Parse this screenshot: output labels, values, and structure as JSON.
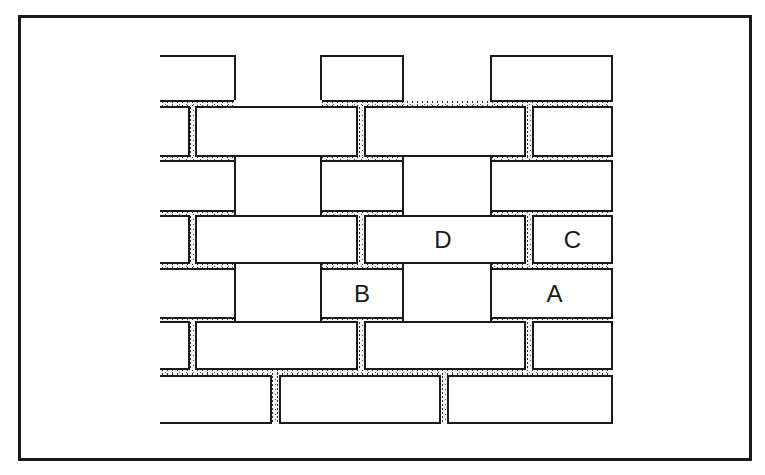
{
  "figure": {
    "type": "brick-wall-diagram",
    "colors": {
      "line": "#1a1a1a",
      "mortar_dots": "#333333",
      "background": "#ffffff"
    }
  },
  "labels": {
    "A": "A",
    "B": "B",
    "C": "C",
    "D": "D"
  },
  "rows": [
    {
      "row": 1,
      "bricks": [
        "",
        "",
        ""
      ]
    },
    {
      "row": 2,
      "bricks": [
        "",
        "",
        "",
        ""
      ]
    },
    {
      "row": 3,
      "bricks": [
        "",
        "",
        ""
      ]
    },
    {
      "row": 4,
      "bricks": [
        "",
        "",
        "D",
        "C"
      ]
    },
    {
      "row": 5,
      "bricks": [
        "",
        "B",
        "A"
      ]
    },
    {
      "row": 6,
      "bricks": [
        "",
        "",
        "",
        ""
      ]
    },
    {
      "row": 7,
      "bricks": [
        "",
        "",
        ""
      ]
    }
  ]
}
